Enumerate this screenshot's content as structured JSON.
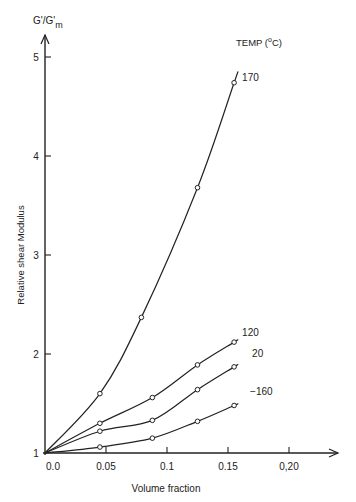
{
  "chart_data": {
    "type": "line",
    "title": "",
    "ylabel_top": "G'/G'",
    "ylabel_top_sub": "m",
    "ylabel": "Relative shear Modulus",
    "xlabel": "Volume fraction",
    "legend_title": "TEMP (°C)",
    "legend_title_parts": {
      "pre": "TEMP (",
      "sup": "o",
      "post": "C)"
    },
    "xlim": [
      0.0,
      0.24
    ],
    "ylim": [
      1,
      5.2
    ],
    "x_ticks": [
      "0.0",
      "0.05",
      "0.1",
      "0.15",
      "0,20"
    ],
    "x_tick_values": [
      0.0,
      0.05,
      0.1,
      0.15,
      0.2
    ],
    "y_ticks": [
      "1",
      "2",
      "3",
      "4",
      "5"
    ],
    "y_tick_values": [
      1,
      2,
      3,
      4,
      5
    ],
    "grid": false,
    "series": [
      {
        "name": "170",
        "x": [
          0.0,
          0.045,
          0.079,
          0.125,
          0.155
        ],
        "y": [
          1.0,
          1.6,
          2.37,
          3.68,
          4.74
        ]
      },
      {
        "name": "120",
        "x": [
          0.0,
          0.045,
          0.088,
          0.125,
          0.155
        ],
        "y": [
          1.0,
          1.3,
          1.56,
          1.89,
          2.12
        ]
      },
      {
        "name": "20",
        "x": [
          0.0,
          0.045,
          0.088,
          0.125,
          0.155
        ],
        "y": [
          1.0,
          1.22,
          1.33,
          1.64,
          1.87
        ]
      },
      {
        "name": "−160",
        "x": [
          0.0,
          0.045,
          0.088,
          0.125,
          0.155
        ],
        "y": [
          1.0,
          1.06,
          1.15,
          1.32,
          1.48
        ]
      }
    ]
  },
  "caption": ""
}
